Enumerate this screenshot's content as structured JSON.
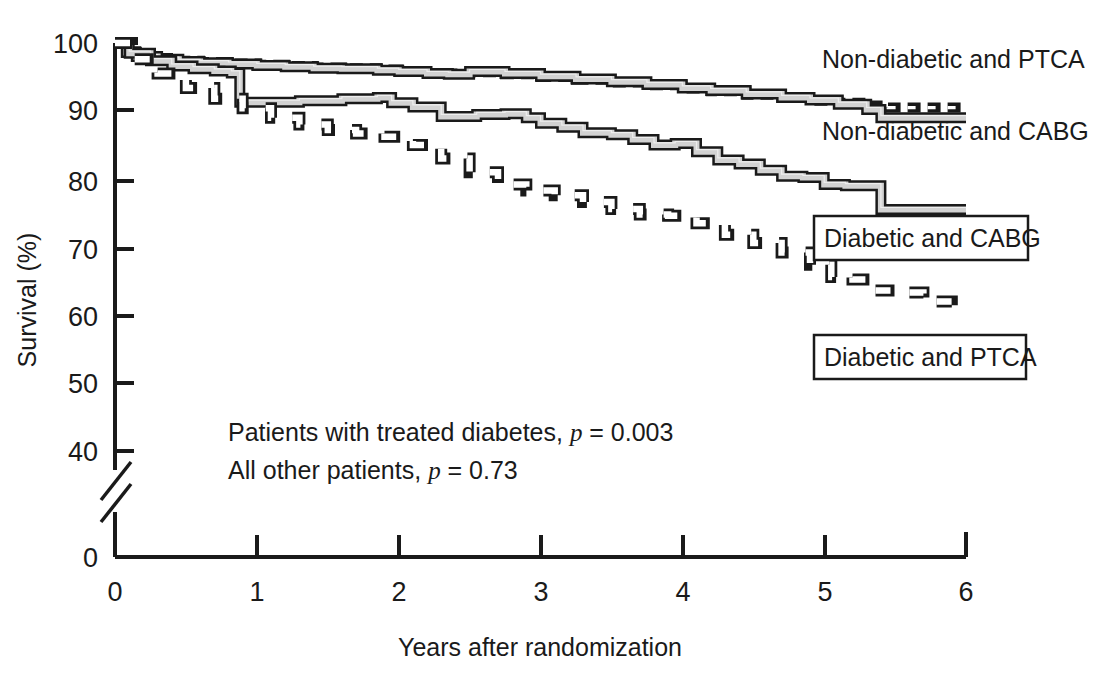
{
  "chart_data": {
    "type": "line",
    "title": "",
    "xlabel": "Years after randomization",
    "ylabel": "Survival (%)",
    "xlim": [
      0,
      6
    ],
    "ylim": [
      40,
      100
    ],
    "y_axis_break": true,
    "y_break_note": "axis broken between 40 and 0",
    "xticks": [
      "0",
      "1",
      "2",
      "3",
      "4",
      "5",
      "6"
    ],
    "yticks": [
      "100",
      "90",
      "80",
      "70",
      "60",
      "50",
      "40",
      "0"
    ],
    "grid": false,
    "legend_position": "inline-right",
    "annotations": [
      "Patients with treated diabetes, p = 0.003",
      "All other patients, p = 0.73"
    ],
    "annotation_lines": [
      {
        "plain_a": "Patients with treated diabetes, ",
        "italic": "p",
        "plain_b": " = 0.003"
      },
      {
        "plain_a": "All other patients, ",
        "italic": "p",
        "plain_b": " = 0.73"
      }
    ],
    "series": [
      {
        "name": "Non-diabetic and PTCA",
        "style": "dashed-black",
        "label_boxed": false,
        "x": [
          0,
          0.08,
          0.15,
          0.3,
          0.45,
          0.6,
          0.8,
          1.0,
          1.2,
          1.4,
          1.6,
          1.85,
          2.0,
          2.2,
          2.35,
          2.5,
          2.75,
          3.0,
          3.25,
          3.5,
          3.75,
          4.0,
          4.2,
          4.45,
          4.7,
          4.9,
          5.1,
          5.3,
          5.45,
          5.6,
          6.0
        ],
        "y": [
          100,
          98.8,
          98.2,
          97.8,
          97.4,
          97.2,
          97.0,
          96.8,
          96.6,
          96.4,
          96.3,
          96.1,
          95.9,
          95.6,
          95.5,
          95.7,
          95.4,
          95.0,
          94.6,
          94.2,
          93.8,
          93.3,
          92.9,
          92.4,
          91.9,
          91.5,
          91.2,
          90.8,
          90.5,
          90.5,
          90.5
        ]
      },
      {
        "name": "Non-diabetic and CABG",
        "style": "solid-gray-3d",
        "label_boxed": false,
        "x": [
          0,
          0.08,
          0.15,
          0.3,
          0.45,
          0.6,
          0.8,
          1.0,
          1.2,
          1.4,
          1.6,
          1.85,
          2.0,
          2.2,
          2.35,
          2.5,
          2.75,
          3.0,
          3.25,
          3.5,
          3.75,
          4.0,
          4.2,
          4.45,
          4.7,
          4.9,
          5.1,
          5.3,
          5.4,
          5.5,
          6.0
        ],
        "y": [
          100,
          98.6,
          98.0,
          97.6,
          97.3,
          97.1,
          96.9,
          96.7,
          96.5,
          96.3,
          96.2,
          96.0,
          95.8,
          95.5,
          95.4,
          95.8,
          95.5,
          95.1,
          94.7,
          94.3,
          93.9,
          93.4,
          93.0,
          92.5,
          92.0,
          91.6,
          91.0,
          90.2,
          89.0,
          89.0,
          89.0
        ]
      },
      {
        "name": "Diabetic and CABG",
        "style": "solid-gray-3d",
        "label_boxed": true,
        "x": [
          0,
          0.1,
          0.25,
          0.4,
          0.55,
          0.7,
          0.82,
          0.88,
          1.0,
          1.3,
          1.6,
          1.85,
          1.95,
          2.1,
          2.3,
          2.4,
          2.55,
          2.75,
          2.9,
          3.0,
          3.15,
          3.3,
          3.5,
          3.65,
          3.8,
          3.95,
          4.1,
          4.25,
          4.4,
          4.55,
          4.7,
          4.85,
          5.0,
          5.15,
          5.3,
          5.4,
          5.5,
          6.0
        ],
        "y": [
          100,
          98.5,
          97.4,
          96.6,
          96.2,
          95.9,
          95.6,
          91.3,
          91.3,
          91.5,
          91.8,
          92.0,
          91.2,
          90.6,
          89.2,
          89.2,
          89.5,
          89.6,
          89.0,
          88.2,
          87.6,
          86.8,
          86.5,
          85.8,
          85.0,
          85.2,
          84.0,
          82.8,
          82.2,
          81.3,
          80.4,
          80.2,
          79.2,
          79.0,
          79.0,
          75.5,
          75.5,
          75.5
        ]
      },
      {
        "name": "Diabetic and PTCA",
        "style": "dashed-open-box",
        "label_boxed": true,
        "x": [
          0,
          0.12,
          0.3,
          0.5,
          0.7,
          0.9,
          1.1,
          1.3,
          1.5,
          1.7,
          1.9,
          2.1,
          2.3,
          2.5,
          2.7,
          2.9,
          3.1,
          3.3,
          3.5,
          3.7,
          3.9,
          4.1,
          4.3,
          4.5,
          4.7,
          4.9,
          5.05,
          5.2,
          5.35,
          5.5,
          5.7,
          5.9
        ],
        "y": [
          100,
          97.6,
          95.5,
          93.4,
          91.8,
          90.4,
          89.0,
          88.0,
          87.2,
          86.7,
          86.2,
          85.0,
          83.0,
          81.0,
          79.2,
          78.3,
          77.6,
          76.6,
          75.6,
          74.8,
          74.6,
          73.5,
          71.8,
          70.6,
          69.2,
          67.4,
          65.6,
          65.2,
          63.6,
          63.3,
          62.0,
          59.2
        ]
      }
    ]
  },
  "labels": {
    "nondiab_ptca": "Non-diabetic and PTCA",
    "nondiab_cabg": "Non-diabetic and CABG",
    "diab_cabg": "Diabetic and CABG",
    "diab_ptca": "Diabetic and PTCA"
  },
  "axis": {
    "y_title": "Survival (%)",
    "x_title": "Years after randomization",
    "y_ticks": [
      "100",
      "90",
      "80",
      "70",
      "60",
      "50",
      "40",
      "0"
    ],
    "x_ticks": [
      "0",
      "1",
      "2",
      "3",
      "4",
      "5",
      "6"
    ]
  },
  "annotations": {
    "line1_a": "Patients with treated diabetes, ",
    "line1_i": "p",
    "line1_b": " = 0.003",
    "line2_a": "All other patients, ",
    "line2_i": "p",
    "line2_b": " = 0.73"
  },
  "colors": {
    "ink": "#1a1a1a",
    "fill_gray": "#cfcfcf",
    "background": "#ffffff"
  }
}
